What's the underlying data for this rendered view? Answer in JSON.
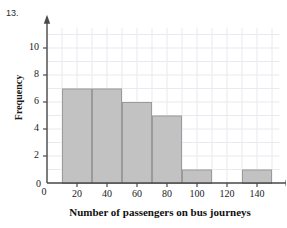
{
  "question": {
    "number": "13."
  },
  "chart_data": {
    "type": "bar",
    "title": "",
    "xlabel": "Number of passengers on bus journeys",
    "ylabel": "Frequency",
    "xlim": [
      0,
      155
    ],
    "ylim": [
      0,
      11.5
    ],
    "grid": true,
    "grid_step_x": 10,
    "grid_step_y": 1,
    "legend": "none",
    "bin_edges": [
      10,
      30,
      50,
      70,
      90,
      110,
      130,
      150
    ],
    "bin_labels": [
      "10-30",
      "30-50",
      "50-70",
      "70-90",
      "90-110",
      "110-130",
      "130-150"
    ],
    "values": [
      7,
      7,
      6,
      5,
      1,
      0,
      1
    ],
    "bars": [
      {
        "x0": 10,
        "x1": 30,
        "height": 7
      },
      {
        "x0": 30,
        "x1": 50,
        "height": 7
      },
      {
        "x0": 50,
        "x1": 70,
        "height": 6
      },
      {
        "x0": 70,
        "x1": 90,
        "height": 5
      },
      {
        "x0": 90,
        "x1": 110,
        "height": 1
      },
      {
        "x0": 130,
        "x1": 150,
        "height": 1
      }
    ],
    "xticks": [
      0,
      20,
      40,
      60,
      80,
      100,
      120,
      140
    ],
    "xtick_labels": [
      "0",
      "20",
      "40",
      "60",
      "80",
      "100",
      "120",
      "140"
    ],
    "yticks": [
      0,
      2,
      4,
      6,
      8,
      10
    ],
    "ytick_labels": [
      "0",
      "2",
      "4",
      "6",
      "8",
      "10"
    ],
    "colors": {
      "bar_fill": "#c2c2c2",
      "bar_edge": "#9a9a9a",
      "axis": "#4a4a4a",
      "grid": "#e9e9ef",
      "text": "#1a1a1a"
    }
  }
}
